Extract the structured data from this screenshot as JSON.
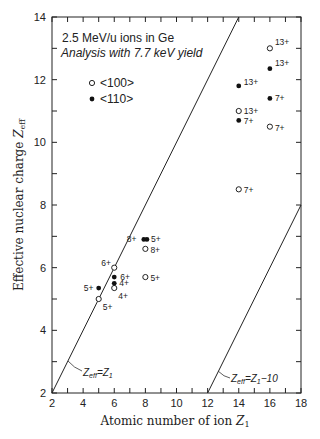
{
  "chart_data": {
    "type": "scatter",
    "title": "2.5 MeV/u ions in Ge",
    "subtitle": "Analysis with 7.7 keV yield",
    "xlabel": "Atomic number of ion Z1",
    "ylabel": "Effective nuclear charge Zeff",
    "xlim": [
      2,
      18
    ],
    "ylim": [
      2,
      14
    ],
    "x_ticks": [
      2,
      4,
      6,
      8,
      10,
      12,
      14,
      16,
      18
    ],
    "y_ticks": [
      2,
      4,
      6,
      8,
      10,
      12,
      14
    ],
    "x_minor_step": 1,
    "y_minor_step": 1,
    "grid": false,
    "legend": {
      "position": "upper-left",
      "entries": [
        {
          "marker": "open-circle",
          "label": "<100>"
        },
        {
          "marker": "filled-circle",
          "label": "<110>"
        }
      ]
    },
    "series": [
      {
        "name": "<100>",
        "marker": "open-circle",
        "points": [
          {
            "x": 5,
            "y": 5.0,
            "label": "5+"
          },
          {
            "x": 6,
            "y": 5.35,
            "label": "4+"
          },
          {
            "x": 6,
            "y": 6.0,
            "label": "6+"
          },
          {
            "x": 8,
            "y": 5.7,
            "label": "5+"
          },
          {
            "x": 8,
            "y": 6.6,
            "label": "8+"
          },
          {
            "x": 14,
            "y": 8.5,
            "label": "7+"
          },
          {
            "x": 14,
            "y": 11.0,
            "label": "13+"
          },
          {
            "x": 16,
            "y": 10.5,
            "label": "7+"
          },
          {
            "x": 16,
            "y": 13.0,
            "label": "13+"
          }
        ]
      },
      {
        "name": "<110>",
        "marker": "filled-circle",
        "points": [
          {
            "x": 5,
            "y": 5.35,
            "label": "5+"
          },
          {
            "x": 6,
            "y": 5.5,
            "label": "4+"
          },
          {
            "x": 6,
            "y": 5.7,
            "label": "6+"
          },
          {
            "x": 7.9,
            "y": 6.9,
            "label": "8+"
          },
          {
            "x": 8.1,
            "y": 6.9,
            "label": "5+"
          },
          {
            "x": 14,
            "y": 10.7,
            "label": "7+"
          },
          {
            "x": 14,
            "y": 11.8,
            "label": "13+"
          },
          {
            "x": 16,
            "y": 11.4,
            "label": "7+"
          },
          {
            "x": 16,
            "y": 12.35,
            "label": "13+"
          }
        ]
      }
    ],
    "reference_lines": [
      {
        "name": "Zeff=Z1",
        "from": [
          2,
          2
        ],
        "to": [
          14,
          14
        ]
      },
      {
        "name": "Zeff=Z1-10",
        "from": [
          12,
          2
        ],
        "to": [
          18,
          8
        ]
      }
    ]
  },
  "text": {
    "title": "2.5 MeV/u ions in Ge",
    "subtitle": "Analysis with 7.7 keV yield",
    "legend_100": "<100>",
    "legend_110": "<110>",
    "xlabel_main": "Atomic number of ion ",
    "xlabel_var": "Z",
    "xlabel_sub": "1",
    "ylabel_main": "Effective nuclear charge ",
    "ylabel_var": "Z",
    "ylabel_sub": "eff",
    "line1_a": "Z",
    "line1_sub": "eff",
    "line1_b": "=Z",
    "line1_sub2": "1",
    "line2_a": "Z",
    "line2_sub": "eff",
    "line2_b": "=Z",
    "line2_sub2": "1",
    "line2_c": "−10"
  }
}
